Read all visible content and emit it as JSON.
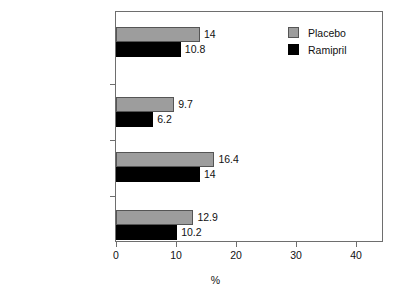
{
  "chart_data": {
    "type": "bar",
    "orientation": "horizontal",
    "title": "",
    "xlabel": "%",
    "ylabel": "",
    "xlim": [
      0,
      45
    ],
    "xticks": [
      0,
      10,
      20,
      30,
      40
    ],
    "xtick_labels": [
      "0",
      "10",
      "20",
      "30",
      "40"
    ],
    "grid": false,
    "legend_position": "top-right",
    "categories": [
      "Total mortality",
      "CV mortality",
      "CABG or PTCA",
      "Myocardial infarction"
    ],
    "series": [
      {
        "name": "Placebo",
        "color": "#9d9d9d",
        "values": [
          14,
          9.7,
          16.4,
          12.9
        ],
        "value_labels": [
          "14",
          "9.7",
          "16.4",
          "12.9"
        ]
      },
      {
        "name": "Ramipril",
        "color": "#000000",
        "values": [
          10.8,
          6.2,
          14,
          10.2
        ],
        "value_labels": [
          "10.8",
          "6.2",
          "14",
          "10.2"
        ]
      }
    ]
  },
  "legend": {
    "items": [
      {
        "label": "Placebo",
        "swatch": "gray-square-swatch"
      },
      {
        "label": "Ramipril",
        "swatch": "black-square-swatch"
      }
    ]
  },
  "axis": {
    "x_title": "%"
  }
}
